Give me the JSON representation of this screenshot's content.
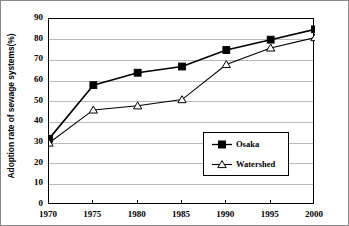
{
  "chart_data": {
    "type": "line",
    "title": "",
    "xlabel": "",
    "ylabel": "Adoption rate of sewage systems(%)",
    "categories": [
      "1970",
      "1975",
      "1980",
      "1985",
      "1990",
      "1995",
      "2000"
    ],
    "x": [
      1970,
      1975,
      1980,
      1985,
      1990,
      1995,
      2000
    ],
    "ylim": [
      0,
      90
    ],
    "yticks": [
      0,
      10,
      20,
      30,
      40,
      50,
      60,
      70,
      80,
      90
    ],
    "ytick_labels": [
      "0",
      "10",
      "20",
      "30",
      "40",
      "50",
      "60",
      "70",
      "80",
      "90"
    ],
    "grid": "horizontal",
    "legend_position": "lower-right-inside",
    "series": [
      {
        "name": "Osaka",
        "marker": "filled-square",
        "color": "#000000",
        "values": [
          32,
          58,
          64,
          67,
          75,
          80,
          85
        ]
      },
      {
        "name": "Watershed",
        "marker": "open-triangle",
        "color": "#000000",
        "values": [
          30,
          46,
          48,
          51,
          68,
          76,
          81
        ]
      }
    ]
  },
  "legend": {
    "items": [
      {
        "label": "Osaka"
      },
      {
        "label": "Watershed"
      }
    ]
  }
}
